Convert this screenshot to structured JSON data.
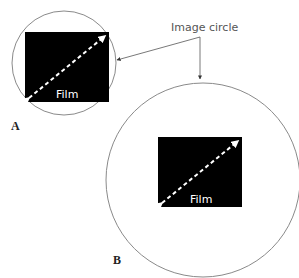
{
  "diagram": {
    "callout": {
      "label": "Image circle"
    },
    "panels": [
      {
        "id": "A",
        "letter": "A",
        "film_label": "Film",
        "circle": {
          "cx": 64,
          "cy": 63,
          "r": 52
        },
        "film": {
          "x": 25,
          "y": 32,
          "w": 84,
          "h": 70
        }
      },
      {
        "id": "B",
        "letter": "B",
        "film_label": "Film",
        "circle": {
          "cx": 203,
          "cy": 180,
          "r": 97
        },
        "film": {
          "x": 158,
          "y": 137,
          "w": 84,
          "h": 70
        }
      }
    ],
    "colors": {
      "circle_stroke": "#8a8a8a",
      "film_fill": "#000000",
      "diagonal": "#ffffff",
      "leader": "#555555",
      "text": "#333333"
    }
  }
}
